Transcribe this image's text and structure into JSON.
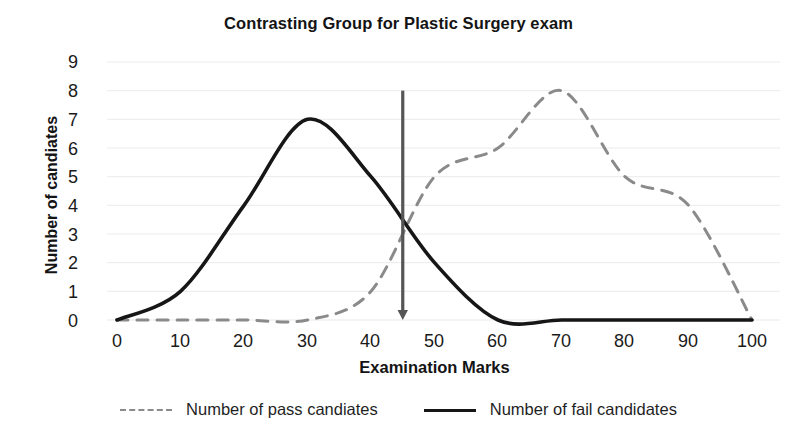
{
  "chart_data": {
    "type": "line",
    "title": "Contrasting Group for Plastic Surgery exam",
    "xlabel": "Examination Marks",
    "ylabel": "Number of candiates",
    "x": [
      0,
      10,
      20,
      30,
      40,
      50,
      60,
      70,
      80,
      90,
      100
    ],
    "xlim": [
      0,
      100
    ],
    "ylim": [
      0,
      9
    ],
    "xticks": [
      "0",
      "10",
      "20",
      "30",
      "40",
      "50",
      "60",
      "70",
      "80",
      "90",
      "100"
    ],
    "yticks": [
      "0",
      "1",
      "2",
      "3",
      "4",
      "5",
      "6",
      "7",
      "8",
      "9"
    ],
    "grid": true,
    "legend_position": "bottom",
    "series": [
      {
        "name": "Number of pass candiates",
        "style": "dashed",
        "color": "#8a8a8a",
        "values": [
          0,
          0,
          0,
          0,
          1,
          5,
          6,
          8,
          5,
          4,
          0
        ]
      },
      {
        "name": "Number of fail candiates",
        "style": "solid",
        "color": "#161616",
        "values": [
          0,
          1,
          4,
          7,
          5,
          2,
          0,
          0,
          0,
          0,
          0
        ]
      }
    ],
    "annotations": [
      {
        "name": "cut-score-arrow",
        "type": "vertical-arrow",
        "x": 45,
        "y_top": 8,
        "y_bottom": 0,
        "color": "#555555"
      }
    ]
  },
  "legend": {
    "entries": [
      {
        "label": "Number of pass candiates",
        "style": "dashed"
      },
      {
        "label": "Number of fail candidates",
        "style": "solid"
      }
    ]
  }
}
